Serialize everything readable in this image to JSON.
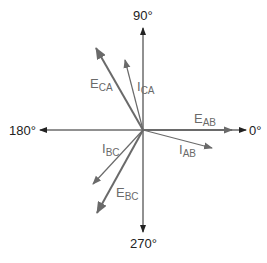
{
  "diagram": {
    "type": "phasor-diagram",
    "axes": {
      "top": "90°",
      "right": "0°",
      "left": "180°",
      "bottom": "270°"
    },
    "colors": {
      "axis": "#222222",
      "phasor": "#6a6a6a"
    },
    "phasors": [
      {
        "id": "E_AB",
        "main": "E",
        "sub": "AB",
        "angle_deg": 0,
        "kind": "voltage"
      },
      {
        "id": "I_AB",
        "main": "I",
        "sub": "AB",
        "angle_deg": -15,
        "kind": "current"
      },
      {
        "id": "E_CA",
        "main": "E",
        "sub": "CA",
        "angle_deg": 120,
        "kind": "voltage"
      },
      {
        "id": "I_CA",
        "main": "I",
        "sub": "CA",
        "angle_deg": 105,
        "kind": "current"
      },
      {
        "id": "E_BC",
        "main": "E",
        "sub": "BC",
        "angle_deg": 240,
        "kind": "voltage"
      },
      {
        "id": "I_BC",
        "main": "I",
        "sub": "BC",
        "angle_deg": 225,
        "kind": "current"
      }
    ]
  }
}
